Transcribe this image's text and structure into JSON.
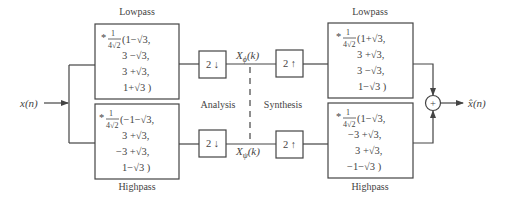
{
  "diagram": {
    "input_label": "x(n)",
    "output_label": "x̂(n)",
    "section_labels": {
      "analysis": "Analysis",
      "synthesis": "Synthesis"
    },
    "channel_labels": {
      "low": "X",
      "low_sub": "ϕ",
      "low_arg": "(k)",
      "high": "X",
      "high_sub": "ψ",
      "high_arg": "(k)"
    },
    "downsample_label": "2 ↓",
    "upsample_label": "2 ↑",
    "sum_symbol": "+",
    "filters": {
      "analysis_lowpass": {
        "label": "Lowpass",
        "scale_star": "*",
        "scale_num": "1",
        "scale_den": "4√2",
        "lines": [
          "(1−√3,",
          "3 −√3,",
          "3 +√3,",
          "1+√3 )"
        ]
      },
      "analysis_highpass": {
        "label": "Highpass",
        "scale_star": "*",
        "scale_num": "1",
        "scale_den": "4√2",
        "lines": [
          "(−1−√3,",
          "3 +√3,",
          "−3 +√3,",
          "1−√3 )"
        ]
      },
      "synthesis_lowpass": {
        "label": "Lowpass",
        "scale_star": "*",
        "scale_num": "1",
        "scale_den": "4√2",
        "lines": [
          "(1+√3,",
          "3 +√3,",
          "3 −√3,",
          "1−√3 )"
        ]
      },
      "synthesis_highpass": {
        "label": "Highpass",
        "scale_star": "*",
        "scale_num": "1",
        "scale_den": "4√2",
        "lines": [
          "(1−√3,",
          "−3 +√3,",
          "3 +√3,",
          "−1−√3 )"
        ]
      }
    },
    "colors": {
      "stroke": "#444444",
      "text": "#444444",
      "background": "#ffffff"
    }
  }
}
